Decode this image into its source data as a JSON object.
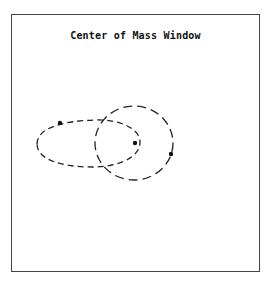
{
  "window": {
    "title": "Center of Mass Window"
  },
  "diagram": {
    "stroke_color": "#222222",
    "shapes": [
      {
        "name": "egg-shaped-orbit",
        "style": "dashed"
      },
      {
        "name": "circular-orbit",
        "style": "dashed"
      }
    ],
    "points": [
      {
        "name": "body-on-egg-orbit"
      },
      {
        "name": "center-of-mass"
      },
      {
        "name": "body-on-circular-orbit"
      }
    ]
  }
}
